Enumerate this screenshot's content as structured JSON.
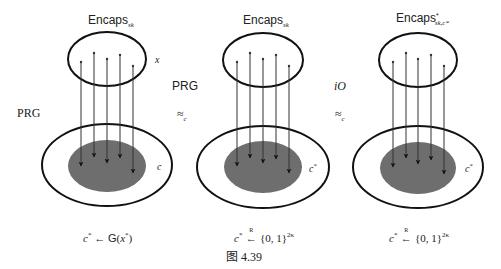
{
  "figure": {
    "caption": "图 4.39",
    "panels": [
      {
        "title_main": "Encaps",
        "title_sub": "sk",
        "title_sup": "",
        "top_set_label": "x",
        "bottom_set_label": "c",
        "bottom_set_label_sup": "",
        "formula_left": "c",
        "formula_left_sup": "*",
        "formula_op": "←",
        "formula_right": "G(x",
        "formula_right_sup": "*",
        "formula_right_end": ")"
      },
      {
        "title_main": "Encaps",
        "title_sub": "sk",
        "title_sup": "",
        "top_set_label": "",
        "bottom_set_label": "c",
        "bottom_set_label_sup": "*",
        "formula_left": "c",
        "formula_left_sup": "*",
        "formula_op": "←",
        "formula_op_over": "R",
        "formula_right": "{0, 1}",
        "formula_right_sup": "2κ"
      },
      {
        "title_main": "Encaps",
        "title_sub": "sk,c*",
        "title_sup": "*",
        "top_set_label": "",
        "bottom_set_label": "c",
        "bottom_set_label_sup": "*",
        "formula_left": "c",
        "formula_left_sup": "*",
        "formula_op": "←",
        "formula_op_over": "R",
        "formula_right": "{0, 1}",
        "formula_right_sup": "2κ"
      }
    ],
    "transitions": [
      {
        "label_left": "PRG"
      },
      {
        "label": "PRG",
        "relation": "≈",
        "relation_sub": "c"
      },
      {
        "label": "iO",
        "relation": "≈",
        "relation_sub": "c"
      }
    ],
    "colors": {
      "stroke": "#111111",
      "arrow_line": "#444444",
      "shaded_region": "#6e6e6e",
      "background": "#ffffff"
    }
  }
}
